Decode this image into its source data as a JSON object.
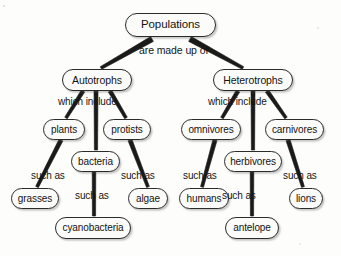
{
  "diagram": {
    "type": "concept-map",
    "background_color": "#fdfdfc",
    "node_fill": "#fbfbfa",
    "node_border_color": "#2b2b2b",
    "text_color": "#131313",
    "connector_color": "#1a1a1a"
  },
  "nodes": [
    {
      "id": "populations",
      "label": "Populations",
      "x": 125,
      "y": 13,
      "w": 91,
      "h": 24,
      "font": 11.5
    },
    {
      "id": "autotrophs",
      "label": "Autotrophs",
      "x": 62,
      "y": 69,
      "w": 70,
      "h": 22,
      "font": 10.5
    },
    {
      "id": "heterotrophs",
      "label": "Heterotrophs",
      "x": 213,
      "y": 69,
      "w": 80,
      "h": 22,
      "font": 10.5
    },
    {
      "id": "plants",
      "label": "plants",
      "x": 43,
      "y": 119,
      "w": 42,
      "h": 21,
      "font": 10
    },
    {
      "id": "protists",
      "label": "protists",
      "x": 103,
      "y": 119,
      "w": 48,
      "h": 21,
      "font": 10
    },
    {
      "id": "bacteria",
      "label": "bacteria",
      "x": 71,
      "y": 151,
      "w": 49,
      "h": 21,
      "font": 10
    },
    {
      "id": "grasses",
      "label": "grasses",
      "x": 11,
      "y": 188,
      "w": 48,
      "h": 21,
      "font": 10
    },
    {
      "id": "algae",
      "label": "algae",
      "x": 128,
      "y": 188,
      "w": 40,
      "h": 21,
      "font": 10
    },
    {
      "id": "cyanobacteria",
      "label": "cyanobacteria",
      "x": 55,
      "y": 217,
      "w": 76,
      "h": 22,
      "font": 10
    },
    {
      "id": "omnivores",
      "label": "omnivores",
      "x": 181,
      "y": 119,
      "w": 60,
      "h": 21,
      "font": 10
    },
    {
      "id": "carnivores",
      "label": "carnivores",
      "x": 265,
      "y": 119,
      "w": 59,
      "h": 21,
      "font": 10
    },
    {
      "id": "herbivores",
      "label": "herbivores",
      "x": 224,
      "y": 151,
      "w": 58,
      "h": 21,
      "font": 10
    },
    {
      "id": "humans",
      "label": "humans",
      "x": 179,
      "y": 188,
      "w": 50,
      "h": 21,
      "font": 10
    },
    {
      "id": "lions",
      "label": "lions",
      "x": 289,
      "y": 188,
      "w": 34,
      "h": 21,
      "font": 10
    },
    {
      "id": "antelope",
      "label": "antelope",
      "x": 225,
      "y": 217,
      "w": 54,
      "h": 22,
      "font": 10
    }
  ],
  "edge_labels": [
    {
      "id": "are-made-up-of",
      "label": "are made up of",
      "x": 139,
      "y": 45,
      "font": 10.5
    },
    {
      "id": "which-include-left",
      "label": "which include",
      "x": 58,
      "y": 97,
      "font": 10
    },
    {
      "id": "which-include-right",
      "label": "which include",
      "x": 208,
      "y": 97,
      "font": 10
    },
    {
      "id": "such-as-plants",
      "label": "such as",
      "x": 31,
      "y": 171,
      "font": 10
    },
    {
      "id": "such-as-protists",
      "label": "such as",
      "x": 121,
      "y": 171,
      "font": 10
    },
    {
      "id": "such-as-bacteria",
      "label": "such as",
      "x": 75,
      "y": 191,
      "font": 10
    },
    {
      "id": "such-as-omnivores",
      "label": "such as",
      "x": 183,
      "y": 171,
      "font": 10
    },
    {
      "id": "such-as-carnivores",
      "label": "such as",
      "x": 283,
      "y": 171,
      "font": 10
    },
    {
      "id": "such-as-herbivores",
      "label": "such as",
      "x": 222,
      "y": 191,
      "font": 10
    }
  ],
  "edges": [
    {
      "id": "populations-autotrophs",
      "from": "populations",
      "to": "autotrophs",
      "x1": 152,
      "y1": 39,
      "x2": 101,
      "y2": 68,
      "w1": 5.5,
      "w2": 3.0
    },
    {
      "id": "populations-heterotrophs",
      "from": "populations",
      "to": "heterotrophs",
      "x1": 190,
      "y1": 39,
      "x2": 243,
      "y2": 68,
      "w1": 5.5,
      "w2": 3.0
    },
    {
      "id": "autotrophs-plants",
      "from": "autotrophs",
      "to": "plants",
      "x1": 83,
      "y1": 91,
      "x2": 66,
      "y2": 118,
      "w1": 4.0,
      "w2": 3.0
    },
    {
      "id": "autotrophs-bacteria",
      "from": "autotrophs",
      "to": "bacteria",
      "x1": 96,
      "y1": 91,
      "x2": 96,
      "y2": 150,
      "w1": 4.0,
      "w2": 3.2
    },
    {
      "id": "autotrophs-protists",
      "from": "autotrophs",
      "to": "protists",
      "x1": 110,
      "y1": 91,
      "x2": 126,
      "y2": 118,
      "w1": 4.0,
      "w2": 3.0
    },
    {
      "id": "plants-grasses",
      "from": "plants",
      "to": "grasses",
      "x1": 61,
      "y1": 140,
      "x2": 37,
      "y2": 187,
      "w1": 4.2,
      "w2": 3.0
    },
    {
      "id": "protists-algae",
      "from": "protists",
      "to": "algae",
      "x1": 130,
      "y1": 140,
      "x2": 148,
      "y2": 187,
      "w1": 4.2,
      "w2": 3.0
    },
    {
      "id": "bacteria-cyanobacteria",
      "from": "bacteria",
      "to": "cyanobacteria",
      "x1": 94,
      "y1": 172,
      "x2": 94,
      "y2": 216,
      "w1": 3.6,
      "w2": 3.2
    },
    {
      "id": "heterotrophs-omnivores",
      "from": "heterotrophs",
      "to": "omnivores",
      "x1": 238,
      "y1": 91,
      "x2": 222,
      "y2": 118,
      "w1": 4.0,
      "w2": 3.0
    },
    {
      "id": "heterotrophs-herbivores",
      "from": "heterotrophs",
      "to": "herbivores",
      "x1": 253,
      "y1": 91,
      "x2": 253,
      "y2": 150,
      "w1": 4.0,
      "w2": 3.2
    },
    {
      "id": "heterotrophs-carnivores",
      "from": "heterotrophs",
      "to": "carnivores",
      "x1": 267,
      "y1": 91,
      "x2": 286,
      "y2": 118,
      "w1": 4.0,
      "w2": 3.0
    },
    {
      "id": "omnivores-humans",
      "from": "omnivores",
      "to": "humans",
      "x1": 215,
      "y1": 140,
      "x2": 202,
      "y2": 187,
      "w1": 4.2,
      "w2": 3.0
    },
    {
      "id": "carnivores-lions",
      "from": "carnivores",
      "to": "lions",
      "x1": 288,
      "y1": 140,
      "x2": 303,
      "y2": 187,
      "w1": 4.2,
      "w2": 3.0
    },
    {
      "id": "herbivores-antelope",
      "from": "herbivores",
      "to": "antelope",
      "x1": 252,
      "y1": 172,
      "x2": 252,
      "y2": 216,
      "w1": 3.6,
      "w2": 3.2
    }
  ]
}
